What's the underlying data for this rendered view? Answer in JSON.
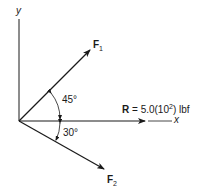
{
  "axes": {
    "x_label": "x",
    "y_label": "y"
  },
  "vectors": {
    "F1": {
      "label": "F",
      "subscript": "1",
      "angle_deg": 45,
      "direction": "above x-axis"
    },
    "F2": {
      "label": "F",
      "subscript": "2",
      "angle_deg": 30,
      "direction": "below x-axis"
    },
    "R": {
      "label": "R",
      "equals": " = 5.0(10",
      "exponent": "2",
      "unit": ") lbf"
    }
  },
  "angles": {
    "a1": "45°",
    "a2": "30°"
  },
  "colors": {
    "stroke": "#1a1a1a",
    "background": "#ffffff"
  }
}
